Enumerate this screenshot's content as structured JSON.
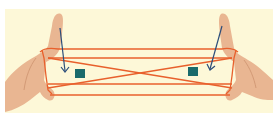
{
  "image": {
    "description": "Two hands holding an orange string figure (cat's cradle) with blue arrows pointing down toward teal square markers",
    "background_color": "#fdf8d8",
    "string_color": "#e8602c",
    "skin_color": "#e8b48f",
    "arrow_color": "#2b4d7a",
    "marker_color": "#1a6b6b"
  }
}
